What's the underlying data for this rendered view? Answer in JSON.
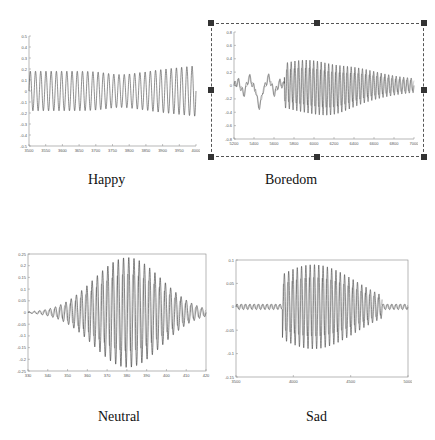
{
  "captions": {
    "happy": "Happy",
    "boredom": "Boredom",
    "neutral": "Neutral",
    "sad": "Sad"
  },
  "chart_data": [
    {
      "type": "line",
      "title": "Happy",
      "xlabel": "",
      "ylabel": "",
      "ylim": [
        -0.5,
        0.5
      ],
      "yticks": [
        "0.5",
        "0.4",
        "0.3",
        "0.2",
        "0.1",
        "0",
        "-0.1",
        "-0.2",
        "-0.3",
        "-0.4",
        "-0.5"
      ],
      "xticks": [
        "3500",
        "3550",
        "3600",
        "3650",
        "3700",
        "3750",
        "3800",
        "3850",
        "3900",
        "3950",
        "4000"
      ],
      "description": "Periodic speech waveform, ~32 cycles, amplitude roughly +/-0.2, slight dip near middle, larger near end",
      "grid": false
    },
    {
      "type": "line",
      "title": "Boredom",
      "xlabel": "",
      "ylabel": "",
      "ylim": [
        -0.8,
        0.8
      ],
      "yticks": [
        "0.8",
        "0.6",
        "0.4",
        "0.2",
        "0",
        "-0.2",
        "-0.4",
        "-0.6",
        "-0.8"
      ],
      "xticks": [
        "5200",
        "5400",
        "5600",
        "5800",
        "6000",
        "6200",
        "6400",
        "6600",
        "6800",
        "7000"
      ],
      "description": "Irregular low-amplitude onset (dip to ~-0.4 near 5450) then dense oscillation peaking ~+/-0.3 around 6000 decaying to ~+/-0.15 by 7000",
      "grid": false,
      "selected": true
    },
    {
      "type": "line",
      "title": "Neutral",
      "xlabel": "",
      "ylabel": "",
      "ylim": [
        -0.25,
        0.25
      ],
      "yticks": [
        "0.25",
        "0.2",
        "0.15",
        "0.1",
        "0.05",
        "0",
        "-0.05",
        "-0.1",
        "-0.15",
        "-0.2",
        "-0.25"
      ],
      "xticks": [
        "330",
        "340",
        "350",
        "360",
        "370",
        "380",
        "390",
        "400",
        "410",
        "420"
      ],
      "description": "Spindle-shaped oscillation, envelope grows to ~+/-0.23 near 390 and tapers to zero at both ends",
      "grid": false
    },
    {
      "type": "line",
      "title": "Sad",
      "xlabel": "",
      "ylabel": "",
      "ylim": [
        -0.15,
        0.1
      ],
      "yticks": [
        "0.1",
        "0.05",
        "0",
        "-0.05",
        "-0.1",
        "-0.15"
      ],
      "xticks": [
        "3500",
        "4000",
        "4500",
        "5000"
      ],
      "description": "Near-zero ripple until ~3880, burst of oscillation ~+/-0.09 from 3900 to 4600, then decay to zero ripple",
      "grid": false
    }
  ]
}
